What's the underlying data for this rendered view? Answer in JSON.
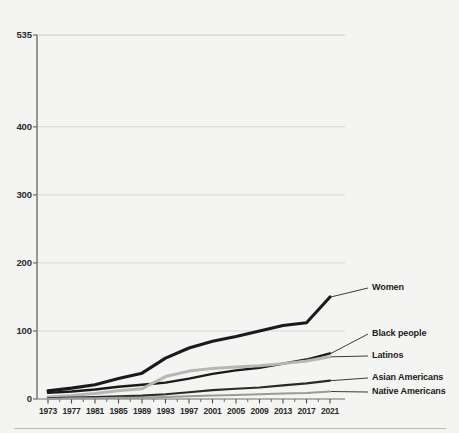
{
  "figure": {
    "clipped_title": "Total Number of Justices",
    "bottom_rule": "divider"
  },
  "chart_data": {
    "type": "line",
    "title": "",
    "xlabel": "",
    "ylabel": "",
    "x": [
      1973,
      1977,
      1981,
      1985,
      1989,
      1993,
      1997,
      2001,
      2005,
      2009,
      2013,
      2017,
      2021
    ],
    "xlim": [
      1971,
      2022
    ],
    "ylim": [
      0,
      535
    ],
    "yticks": [
      0,
      100,
      200,
      300,
      400,
      535
    ],
    "ytick_labels": [
      "0",
      "100",
      "200",
      "300",
      "400",
      "535"
    ],
    "xtick_labels": [
      "1973",
      "1977",
      "1981",
      "1985",
      "1989",
      "1993",
      "1997",
      "2001",
      "2005",
      "2009",
      "2013",
      "2017",
      "2021"
    ],
    "grid": "horizontal",
    "legend_position": "right-inline",
    "series": [
      {
        "name": "Women",
        "color": "#1a1a1a",
        "width": 3.1,
        "label_x": 372,
        "label_y": 288,
        "values": [
          12,
          16,
          21,
          30,
          38,
          60,
          75,
          85,
          92,
          100,
          108,
          112,
          150
        ]
      },
      {
        "name": "Black people",
        "color": "#1a1a1a",
        "width": 2.4,
        "label_x": 372,
        "label_y": 334,
        "values": [
          9,
          11,
          14,
          18,
          21,
          24,
          30,
          37,
          42,
          46,
          52,
          58,
          67
        ]
      },
      {
        "name": "Latinos",
        "color": "#b6b6b4",
        "width": 3.0,
        "label_x": 372,
        "label_y": 356,
        "values": [
          3,
          5,
          8,
          12,
          15,
          33,
          41,
          45,
          47,
          49,
          52,
          56,
          62
        ]
      },
      {
        "name": "Asian Americans",
        "color": "#2a2a2a",
        "width": 2.1,
        "label_x": 372,
        "label_y": 378,
        "values": [
          1,
          2,
          3,
          4,
          5,
          7,
          10,
          13,
          15,
          17,
          20,
          23,
          27
        ]
      },
      {
        "name": "Native Americans",
        "color": "#9a9a98",
        "width": 2.0,
        "label_x": 372,
        "label_y": 392,
        "values": [
          0,
          1,
          1,
          2,
          2,
          3,
          4,
          5,
          6,
          7,
          8,
          9,
          11
        ]
      }
    ]
  }
}
